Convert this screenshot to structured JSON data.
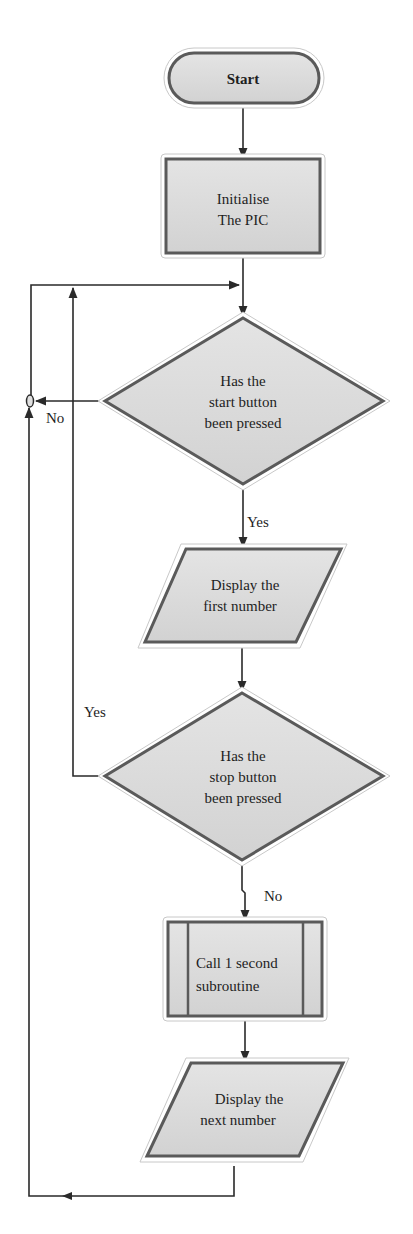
{
  "diagram": {
    "type": "flowchart",
    "colors": {
      "background": "#ffffff",
      "node_fill": "#d9d9d9",
      "node_border": "#5a5a5a",
      "halo": "#ffffff",
      "edge": "#2a2a2a",
      "text": "#1e1e1e"
    },
    "nodes": [
      {
        "id": "start",
        "shape": "terminal",
        "lines": [
          "Start"
        ]
      },
      {
        "id": "init",
        "shape": "process",
        "lines": [
          "Initialise",
          "The PIC"
        ]
      },
      {
        "id": "start_check",
        "shape": "decision",
        "lines": [
          "Has the",
          "start button",
          "been pressed"
        ]
      },
      {
        "id": "display_first",
        "shape": "io",
        "lines": [
          "Display the",
          "first number"
        ]
      },
      {
        "id": "stop_check",
        "shape": "decision",
        "lines": [
          "Has the",
          "stop button",
          "been pressed"
        ]
      },
      {
        "id": "call_sub",
        "shape": "predefined-process",
        "lines": [
          "Call 1 second",
          "subroutine"
        ]
      },
      {
        "id": "display_next",
        "shape": "io",
        "lines": [
          "Display the",
          "next number"
        ]
      }
    ],
    "edge_labels": {
      "start_no": "No",
      "start_yes": "Yes",
      "stop_yes": "Yes",
      "stop_no": "No"
    },
    "edges": [
      {
        "from": "start",
        "to": "init",
        "label": ""
      },
      {
        "from": "init",
        "to": "start_check",
        "label": ""
      },
      {
        "from": "start_check",
        "to": "start_check",
        "label": "No"
      },
      {
        "from": "start_check",
        "to": "display_first",
        "label": "Yes"
      },
      {
        "from": "display_first",
        "to": "stop_check",
        "label": ""
      },
      {
        "from": "stop_check",
        "to": "start_check",
        "label": "Yes"
      },
      {
        "from": "stop_check",
        "to": "call_sub",
        "label": "No"
      },
      {
        "from": "call_sub",
        "to": "display_next",
        "label": ""
      },
      {
        "from": "display_next",
        "to": "start_check",
        "label": ""
      }
    ]
  }
}
